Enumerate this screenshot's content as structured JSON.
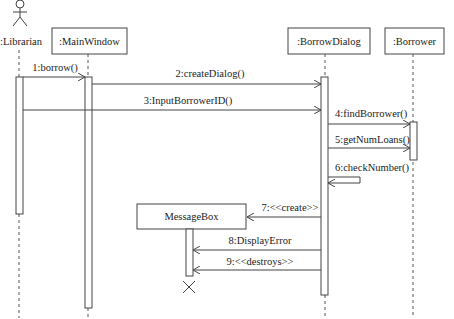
{
  "diagram": {
    "type": "uml-sequence",
    "participants": [
      {
        "id": "librarian",
        "label": ":Librarian",
        "kind": "actor"
      },
      {
        "id": "mainwindow",
        "label": ":MainWindow",
        "kind": "object"
      },
      {
        "id": "borrowdialog",
        "label": ":BorrowDialog",
        "kind": "object"
      },
      {
        "id": "borrower",
        "label": ":Borrower",
        "kind": "object"
      },
      {
        "id": "messagebox",
        "label": "MessageBox",
        "kind": "object"
      }
    ],
    "messages": [
      {
        "label": "1:borrow()",
        "from": "librarian",
        "to": "mainwindow"
      },
      {
        "label": "2:createDialog()",
        "from": "mainwindow",
        "to": "borrowdialog"
      },
      {
        "label": "3:InputBorrowerID()",
        "from": "librarian",
        "to": "borrowdialog"
      },
      {
        "label": "4:findBorrower()",
        "from": "borrowdialog",
        "to": "borrower"
      },
      {
        "label": "5:getNumLoans()",
        "from": "borrowdialog",
        "to": "borrower"
      },
      {
        "label": "6:checkNumber()",
        "from": "borrowdialog",
        "to": "borrowdialog"
      },
      {
        "label": "7:<<create>>",
        "from": "borrowdialog",
        "to": "messagebox"
      },
      {
        "label": "8:DisplayError",
        "from": "borrowdialog",
        "to": "messagebox"
      },
      {
        "label": "9:<<destroys>>",
        "from": "borrowdialog",
        "to": "messagebox"
      }
    ]
  }
}
